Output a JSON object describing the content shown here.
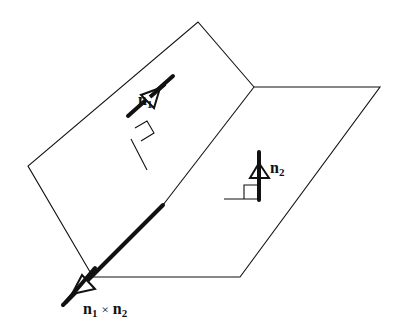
{
  "figure": {
    "type": "diagram",
    "colors": {
      "stroke": "#111111",
      "background": "#ffffff"
    }
  },
  "labels": {
    "n1": {
      "base": "n",
      "sub": "1"
    },
    "n2": {
      "base": "n",
      "sub": "2"
    },
    "cross": {
      "base1": "n",
      "sub1": "1",
      "op": "×",
      "base2": "n",
      "sub2": "2"
    }
  },
  "elements": {
    "plane1": {
      "name": "tilted plane",
      "vertices": [
        [
          198,
          22
        ],
        [
          254,
          87
        ],
        [
          93,
          277
        ],
        [
          28,
          166
        ]
      ]
    },
    "plane2": {
      "name": "horizontal plane",
      "vertices": [
        [
          254,
          87
        ],
        [
          380,
          87
        ],
        [
          240,
          277
        ],
        [
          93,
          277
        ]
      ]
    },
    "intersection_line": {
      "from": [
        254,
        87
      ],
      "to": [
        93,
        277
      ]
    },
    "normal_n1": {
      "from": [
        128,
        116
      ],
      "to": [
        173,
        76
      ]
    },
    "normal_n2": {
      "from": [
        259,
        193
      ],
      "to": [
        259,
        151
      ]
    },
    "cross_product_vector": {
      "from": [
        163,
        205
      ],
      "to": [
        63,
        305
      ]
    }
  }
}
